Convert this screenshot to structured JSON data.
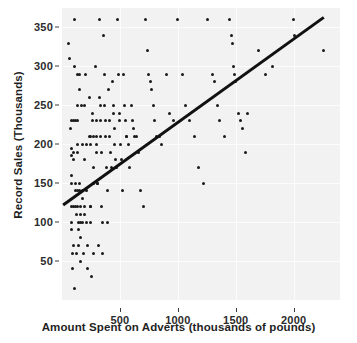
{
  "chart_data": {
    "type": "scatter",
    "title": "",
    "xlabel": "Amount Spent on Adverts (thousands of pounds)",
    "ylabel": "Record Sales (Thousands)",
    "xlim": [
      0,
      2400
    ],
    "ylim": [
      0,
      375
    ],
    "xticks": [
      500,
      1000,
      1500,
      2000
    ],
    "xtick_labels": [
      "500",
      "1000",
      "1500",
      "2000"
    ],
    "yticks": [
      50,
      100,
      150,
      200,
      250,
      300,
      350
    ],
    "ytick_labels": [
      "50",
      "100",
      "150",
      "200",
      "250",
      "300",
      "350"
    ],
    "grid": true,
    "legend": false,
    "panel_background": "#f2f2f2",
    "marker_color": "#1a1a1a",
    "line_color": "#111111",
    "fit_line": {
      "label": "linear regression fit",
      "x_start": 10,
      "y_start": 122,
      "x_end": 2260,
      "y_end": 363
    },
    "points": [
      [
        60,
        330
      ],
      [
        66,
        310
      ],
      [
        72,
        220
      ],
      [
        78,
        195
      ],
      [
        78,
        185
      ],
      [
        80,
        150
      ],
      [
        80,
        120
      ],
      [
        84,
        230
      ],
      [
        84,
        160
      ],
      [
        84,
        100
      ],
      [
        86,
        90
      ],
      [
        88,
        60
      ],
      [
        90,
        40
      ],
      [
        96,
        230
      ],
      [
        96,
        180
      ],
      [
        98,
        190
      ],
      [
        98,
        120
      ],
      [
        100,
        70
      ],
      [
        104,
        15
      ],
      [
        110,
        360
      ],
      [
        112,
        300
      ],
      [
        116,
        230
      ],
      [
        116,
        150
      ],
      [
        118,
        140
      ],
      [
        120,
        120
      ],
      [
        122,
        110
      ],
      [
        124,
        60
      ],
      [
        130,
        290
      ],
      [
        132,
        250
      ],
      [
        132,
        200
      ],
      [
        134,
        230
      ],
      [
        136,
        190
      ],
      [
        136,
        140
      ],
      [
        138,
        120
      ],
      [
        140,
        100
      ],
      [
        142,
        90
      ],
      [
        144,
        70
      ],
      [
        148,
        290
      ],
      [
        150,
        270
      ],
      [
        152,
        150
      ],
      [
        154,
        140
      ],
      [
        156,
        120
      ],
      [
        158,
        110
      ],
      [
        160,
        100
      ],
      [
        162,
        80
      ],
      [
        164,
        50
      ],
      [
        170,
        250
      ],
      [
        174,
        200
      ],
      [
        176,
        140
      ],
      [
        178,
        130
      ],
      [
        180,
        100
      ],
      [
        182,
        60
      ],
      [
        190,
        250
      ],
      [
        192,
        180
      ],
      [
        196,
        120
      ],
      [
        198,
        110
      ],
      [
        204,
        290
      ],
      [
        208,
        200
      ],
      [
        212,
        140
      ],
      [
        214,
        100
      ],
      [
        216,
        70
      ],
      [
        220,
        40
      ],
      [
        236,
        260
      ],
      [
        240,
        210
      ],
      [
        242,
        210
      ],
      [
        244,
        200
      ],
      [
        246,
        120
      ],
      [
        248,
        120
      ],
      [
        250,
        100
      ],
      [
        252,
        30
      ],
      [
        262,
        240
      ],
      [
        266,
        230
      ],
      [
        270,
        210
      ],
      [
        272,
        170
      ],
      [
        274,
        150
      ],
      [
        276,
        60
      ],
      [
        290,
        300
      ],
      [
        294,
        230
      ],
      [
        298,
        210
      ],
      [
        300,
        200
      ],
      [
        302,
        190
      ],
      [
        306,
        150
      ],
      [
        308,
        150
      ],
      [
        312,
        70
      ],
      [
        322,
        360
      ],
      [
        328,
        260
      ],
      [
        330,
        250
      ],
      [
        334,
        230
      ],
      [
        336,
        210
      ],
      [
        340,
        190
      ],
      [
        344,
        120
      ],
      [
        348,
        100
      ],
      [
        352,
        60
      ],
      [
        360,
        340
      ],
      [
        366,
        290
      ],
      [
        370,
        250
      ],
      [
        374,
        230
      ],
      [
        378,
        210
      ],
      [
        384,
        170
      ],
      [
        390,
        140
      ],
      [
        396,
        100
      ],
      [
        404,
        270
      ],
      [
        408,
        230
      ],
      [
        414,
        210
      ],
      [
        420,
        190
      ],
      [
        424,
        170
      ],
      [
        436,
        280
      ],
      [
        442,
        250
      ],
      [
        444,
        240
      ],
      [
        450,
        220
      ],
      [
        456,
        200
      ],
      [
        460,
        180
      ],
      [
        470,
        170
      ],
      [
        480,
        360
      ],
      [
        486,
        290
      ],
      [
        494,
        240
      ],
      [
        500,
        230
      ],
      [
        506,
        200
      ],
      [
        512,
        180
      ],
      [
        520,
        140
      ],
      [
        530,
        290
      ],
      [
        540,
        250
      ],
      [
        548,
        230
      ],
      [
        556,
        210
      ],
      [
        560,
        210
      ],
      [
        570,
        200
      ],
      [
        580,
        170
      ],
      [
        600,
        250
      ],
      [
        610,
        230
      ],
      [
        620,
        220
      ],
      [
        630,
        210
      ],
      [
        640,
        210
      ],
      [
        660,
        190
      ],
      [
        680,
        140
      ],
      [
        700,
        120
      ],
      [
        720,
        360
      ],
      [
        740,
        320
      ],
      [
        750,
        290
      ],
      [
        760,
        280
      ],
      [
        770,
        270
      ],
      [
        790,
        250
      ],
      [
        800,
        230
      ],
      [
        820,
        210
      ],
      [
        840,
        210
      ],
      [
        860,
        200
      ],
      [
        900,
        290
      ],
      [
        930,
        240
      ],
      [
        960,
        230
      ],
      [
        1000,
        360
      ],
      [
        1040,
        290
      ],
      [
        1070,
        250
      ],
      [
        1100,
        230
      ],
      [
        1140,
        210
      ],
      [
        1180,
        170
      ],
      [
        1220,
        150
      ],
      [
        1260,
        360
      ],
      [
        1300,
        290
      ],
      [
        1320,
        280
      ],
      [
        1340,
        250
      ],
      [
        1360,
        230
      ],
      [
        1400,
        210
      ],
      [
        1450,
        360
      ],
      [
        1460,
        340
      ],
      [
        1470,
        330
      ],
      [
        1480,
        300
      ],
      [
        1490,
        290
      ],
      [
        1500,
        280
      ],
      [
        1520,
        240
      ],
      [
        1540,
        230
      ],
      [
        1560,
        220
      ],
      [
        1580,
        190
      ],
      [
        1600,
        240
      ],
      [
        1700,
        320
      ],
      [
        1760,
        290
      ],
      [
        1820,
        300
      ],
      [
        2000,
        360
      ],
      [
        2010,
        340
      ],
      [
        2260,
        320
      ]
    ]
  }
}
